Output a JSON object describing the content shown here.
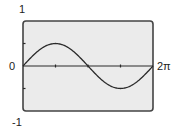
{
  "chart_data": {
    "type": "line",
    "title": "",
    "xlabel": "",
    "ylabel": "",
    "function": "y = 0.5 * sin(x)",
    "xlim": [
      0,
      6.2832
    ],
    "ylim": [
      -1,
      1
    ],
    "x_tick_labels": [
      "0",
      "2π"
    ],
    "y_tick_labels": [
      "1",
      "-1"
    ],
    "x_ticks": [
      1.5708,
      3.1416,
      4.7124
    ],
    "y_ticks": [
      0.5,
      -0.5
    ],
    "grid": false,
    "legend": null,
    "series": [
      {
        "name": "0.5 sin(x)",
        "x": [
          0,
          0.7854,
          1.5708,
          2.3562,
          3.1416,
          3.927,
          4.7124,
          5.4978,
          6.2832
        ],
        "values": [
          0,
          0.354,
          0.5,
          0.354,
          0,
          -0.354,
          -0.5,
          -0.354,
          0
        ]
      }
    ]
  },
  "labels": {
    "y_max": "1",
    "y_min": "-1",
    "x_min": "0",
    "x_max": "2π"
  },
  "colors": {
    "screen_bg": "#ebebeb",
    "frame": "#444444",
    "curve": "#2a2a2a",
    "axis": "#2a2a2a"
  }
}
